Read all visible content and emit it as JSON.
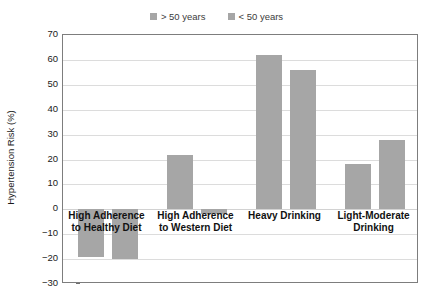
{
  "chart_data": {
    "type": "bar",
    "title": "",
    "subtitle": "",
    "xlabel": "",
    "ylabel": "Hypertension Risk (%)",
    "ylim": [
      -30,
      70
    ],
    "ytick_values": [
      70,
      60,
      50,
      40,
      30,
      20,
      10,
      0,
      -10,
      -20,
      -30
    ],
    "ytick_labels": [
      "70",
      "60",
      "50",
      "40",
      "30",
      "20",
      "10",
      "0",
      "−10",
      "−20",
      "−30"
    ],
    "grid": true,
    "grid_axis": "y",
    "legend_position": "top-center",
    "categories": [
      "High Adherence\nto Healthy Diet",
      "High Adherence\nto Western Diet",
      "Heavy Drinking",
      "Light-Moderate\nDrinking"
    ],
    "series": [
      {
        "name": "> 50 years",
        "color": "#a6a6a6",
        "values": [
          -19,
          22,
          62,
          18
        ]
      },
      {
        "name": "< 50 years",
        "color": "#a6a6a6",
        "values": [
          -20,
          -2,
          56,
          28
        ]
      }
    ]
  },
  "legend": {
    "entries": [
      {
        "label": "> 50 years",
        "swatch_color": "#a6a6a6"
      },
      {
        "label": "< 50 years",
        "swatch_color": "#a6a6a6"
      }
    ]
  },
  "axis": {
    "y_title": "Hypertension Risk (%)"
  },
  "categories_display": [
    {
      "line1": "High Adherence",
      "line2": "to Healthy Diet"
    },
    {
      "line1": "High Adherence",
      "line2": "to Western Diet"
    },
    {
      "line1": "Heavy Drinking",
      "line2": ""
    },
    {
      "line1": "Light-Moderate",
      "line2": "Drinking"
    }
  ]
}
